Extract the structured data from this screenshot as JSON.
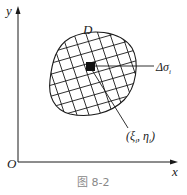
{
  "figure": {
    "caption": "图 8-2",
    "axes": {
      "x_label": "x",
      "y_label": "y",
      "origin_label": "O"
    },
    "region_label": "D",
    "element_label": "Δσ",
    "element_subscript": "i",
    "point_label": "(ξ",
    "point_label_mid": ", η",
    "point_label_end": ")",
    "point_subscript": "i",
    "colors": {
      "ink": "#1a1a1a",
      "caption": "#888888",
      "background": "#ffffff"
    }
  }
}
